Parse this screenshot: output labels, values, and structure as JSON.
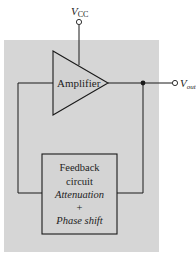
{
  "diagram": {
    "type": "block-diagram",
    "title": "",
    "colors": {
      "panel": "#d6d6d6",
      "amplifier_fill": "#d2d2d2",
      "feedback_fill": "#d4d4d4",
      "line": "#1a1a1a",
      "background": "#ffffff"
    },
    "supply": {
      "label_main": "V",
      "label_sub": "CC"
    },
    "output": {
      "label_main": "V",
      "label_sub": "out"
    },
    "amplifier": {
      "label": "Amplifier"
    },
    "feedback": {
      "line1": "Feedback",
      "line2": "circuit",
      "line3": "Attenuation",
      "line4": "+",
      "line5": "Phase shift"
    }
  }
}
